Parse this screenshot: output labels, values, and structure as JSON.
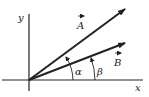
{
  "diagram": {
    "type": "vector-angles",
    "axes": {
      "x_label": "x",
      "y_label": "y"
    },
    "vectors": [
      {
        "name": "A",
        "label": "A",
        "angle_label": "α"
      },
      {
        "name": "B",
        "label": "B",
        "angle_label": "β"
      }
    ],
    "colors": {
      "ink": "#222222",
      "background": "#ffffff"
    }
  }
}
